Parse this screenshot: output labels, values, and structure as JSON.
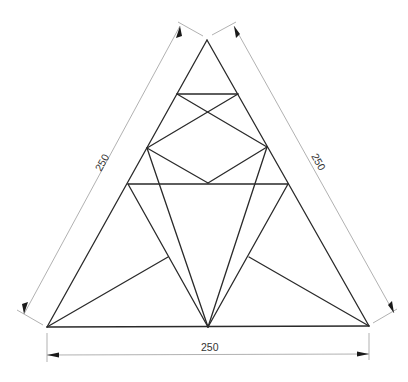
{
  "drawing": {
    "title": "Equilateral triangle subdivision construction",
    "colors": {
      "geometry": "#2a2a2a",
      "dimension": "#a8a8a8",
      "arrow": "#1a1a1a",
      "text": "#333333"
    },
    "vertices": {
      "A_apex": [
        207,
        40
      ],
      "B_bottom_left": [
        47,
        327
      ],
      "C_bottom_right": [
        369,
        326
      ],
      "M_bottom_mid": [
        208,
        327
      ],
      "P_left": [
        147,
        148
      ],
      "Q_left": [
        128,
        184
      ],
      "R_right": [
        267,
        147
      ],
      "S_right": [
        288,
        184
      ],
      "T1": [
        177,
        94
      ],
      "T2": [
        238,
        94
      ],
      "D_diamond_bottom": [
        208,
        183
      ],
      "F_left_foot": [
        168,
        257
      ],
      "F_right_foot": [
        249,
        257
      ]
    },
    "dimensions": {
      "left_side": "250",
      "right_side": "250",
      "bottom": "250"
    }
  }
}
